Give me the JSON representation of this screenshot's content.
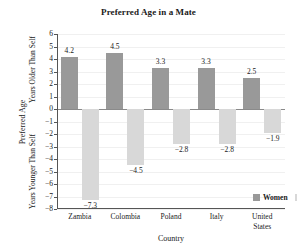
{
  "chart_data": {
    "type": "bar",
    "title": "Preferred Age in a Mate",
    "xlabel": "Country",
    "ylabel": "Preferred Age",
    "ylabel_upper": "Years Older Than Self",
    "ylabel_lower": "Years Younger Than Self",
    "categories": [
      "Zambia",
      "Colombia",
      "Poland",
      "Italy",
      "United\nStates"
    ],
    "series": [
      {
        "name": "Women",
        "color": "#999999",
        "values": [
          4.2,
          4.5,
          3.3,
          3.3,
          2.5
        ]
      },
      {
        "name": "Men",
        "color": "#d8d8d8",
        "values": [
          -7.3,
          -4.5,
          -2.8,
          -2.8,
          -1.9
        ]
      }
    ],
    "value_labels": {
      "women": [
        "4.2",
        "4.5",
        "3.3",
        "3.3",
        "2.5"
      ],
      "men": [
        "−7.3",
        "−4.5",
        "−2.8",
        "−2.8",
        "−1.9"
      ]
    },
    "ylim": [
      -8,
      6
    ],
    "yticks": [
      6,
      5,
      4,
      3,
      2,
      1,
      0,
      -1,
      -2,
      -3,
      -4,
      -5,
      -6,
      -7,
      -8
    ],
    "ytick_labels": [
      "6",
      "5",
      "4",
      "3",
      "2",
      "1",
      "0",
      "−1",
      "−2",
      "−3",
      "−4",
      "−5",
      "−6",
      "−7",
      "−8"
    ],
    "grid": true,
    "legend_position": "inside-lower-right",
    "legend": [
      "Women",
      "Men"
    ]
  }
}
